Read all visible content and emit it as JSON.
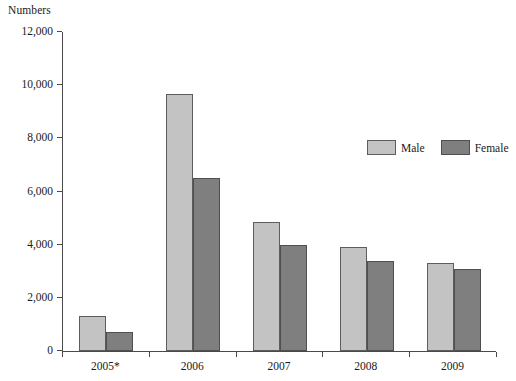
{
  "chart_data": {
    "type": "bar",
    "title": "",
    "xlabel": "",
    "ylabel": "Numbers",
    "categories": [
      "2005*",
      "2006",
      "2007",
      "2008",
      "2009"
    ],
    "series": [
      {
        "name": "Male",
        "color": "#c3c3c3",
        "values": [
          1300,
          9650,
          4850,
          3900,
          3300
        ]
      },
      {
        "name": "Female",
        "color": "#7f7f7f",
        "values": [
          700,
          6500,
          4000,
          3400,
          3100
        ]
      }
    ],
    "ylim": [
      0,
      12000
    ],
    "ytick_step": 2000,
    "ytick_labels": [
      "0",
      "2,000",
      "4,000",
      "6,000",
      "8,000",
      "10,000",
      "12,000"
    ],
    "ytick_values": [
      0,
      2000,
      4000,
      6000,
      8000,
      10000,
      12000
    ],
    "grid": false,
    "legend_position": "upper right"
  },
  "legend": {
    "items": [
      {
        "label": "Male",
        "swatch": "male"
      },
      {
        "label": "Female",
        "swatch": "female"
      }
    ]
  }
}
